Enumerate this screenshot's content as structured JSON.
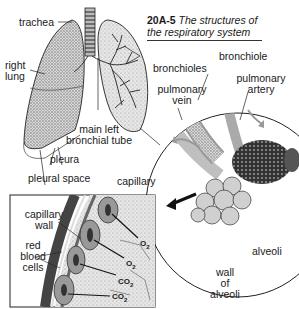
{
  "figure": {
    "number": "20A-5",
    "caption_line1": "The structures of",
    "caption_line2": "the respiratory system"
  },
  "labels": {
    "trachea": "trachea",
    "right_lung_1": "right",
    "right_lung_2": "lung",
    "bronchioles": "bronchioles",
    "bronchiole": "bronchiole",
    "pulmonary_vein_1": "pulmonary",
    "pulmonary_vein_2": "vein",
    "pulmonary_artery_1": "pulmonary",
    "pulmonary_artery_2": "artery",
    "main_left_1": "main left",
    "main_left_2": "bronchial tube",
    "pleura": "pleura",
    "pleural_space": "pleural space",
    "capillary": "capillary",
    "capillary_wall_1": "capillary",
    "capillary_wall_2": "wall",
    "rbc_1": "red",
    "rbc_2": "blood",
    "rbc_3": "cells",
    "alveoli": "alveoli",
    "wall_alveoli_1": "wall",
    "wall_alveoli_2": "of",
    "wall_alveoli_3": "alveoli"
  },
  "gases": {
    "o2_a": "O",
    "o2_b": "O",
    "co2_a": "CO",
    "co2_b": "CO",
    "sub2": "2"
  },
  "colors": {
    "ink": "#1a1a1a",
    "stipple": "#9a9a9a",
    "dark_shade": "#555555",
    "light_gray": "#cfcfcf",
    "paper": "#ffffff"
  }
}
